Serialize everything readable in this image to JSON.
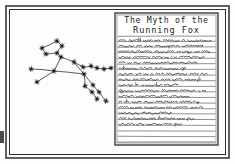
{
  "scene": {
    "kind": "hand-drawn-sketch",
    "background_color": "#fdfdfb",
    "ink_color": "#2b2b2b",
    "frame": {
      "name": "double-line-border",
      "outer": {
        "x": 6,
        "y": 6,
        "width": 223,
        "height": 152
      },
      "inner": {
        "x": 9,
        "y": 9,
        "width": 217,
        "height": 146
      },
      "stroke_color": "#3a3a3a"
    },
    "left_panel": {
      "title": "fox constellation sketch",
      "description": "star map of a leaping fox drawn as dots joined by straight lines"
    },
    "right_panel": {
      "title": "ruled notebook page",
      "description": "lined paper with a hand printed heading and illegible cursive body text"
    }
  },
  "constellation": {
    "name": "running-fox-constellation",
    "star_color": "#1f1f1f",
    "line_color": "#3c3c3c",
    "stars": [
      {
        "id": "ear-tip",
        "x": 57,
        "y": 41
      },
      {
        "id": "brow",
        "x": 62,
        "y": 46
      },
      {
        "id": "snout-upper",
        "x": 42,
        "y": 48
      },
      {
        "id": "snout-lower",
        "x": 46,
        "y": 54
      },
      {
        "id": "cheek",
        "x": 57,
        "y": 53
      },
      {
        "id": "neck",
        "x": 61,
        "y": 57
      },
      {
        "id": "shoulder",
        "x": 54,
        "y": 71
      },
      {
        "id": "chest",
        "x": 31,
        "y": 69
      },
      {
        "id": "foreleg-toe",
        "x": 37,
        "y": 82
      },
      {
        "id": "back-mid",
        "x": 74,
        "y": 62
      },
      {
        "id": "haunch",
        "x": 84,
        "y": 74
      },
      {
        "id": "tail-base",
        "x": 83,
        "y": 67
      },
      {
        "id": "tail-a",
        "x": 91,
        "y": 66
      },
      {
        "id": "tail-b",
        "x": 97,
        "y": 68
      },
      {
        "id": "tail-c",
        "x": 104,
        "y": 69
      },
      {
        "id": "tail-tip",
        "x": 111,
        "y": 68
      },
      {
        "id": "hind-a-knee",
        "x": 85,
        "y": 86
      },
      {
        "id": "hind-a-hock",
        "x": 92,
        "y": 92
      },
      {
        "id": "hind-a-toe",
        "x": 97,
        "y": 99
      },
      {
        "id": "hind-b-knee",
        "x": 93,
        "y": 85
      },
      {
        "id": "hind-b-hock",
        "x": 99,
        "y": 92
      },
      {
        "id": "hind-b-toe",
        "x": 106,
        "y": 101
      }
    ],
    "links": [
      [
        "snout-upper",
        "ear-tip"
      ],
      [
        "ear-tip",
        "brow"
      ],
      [
        "brow",
        "cheek"
      ],
      [
        "cheek",
        "snout-lower"
      ],
      [
        "snout-lower",
        "snout-upper"
      ],
      [
        "cheek",
        "neck"
      ],
      [
        "neck",
        "shoulder"
      ],
      [
        "shoulder",
        "chest"
      ],
      [
        "shoulder",
        "foreleg-toe"
      ],
      [
        "neck",
        "back-mid"
      ],
      [
        "back-mid",
        "tail-base"
      ],
      [
        "tail-base",
        "tail-a"
      ],
      [
        "tail-a",
        "tail-b"
      ],
      [
        "tail-b",
        "tail-c"
      ],
      [
        "tail-c",
        "tail-tip"
      ],
      [
        "back-mid",
        "haunch"
      ],
      [
        "shoulder",
        "haunch"
      ],
      [
        "haunch",
        "hind-a-knee"
      ],
      [
        "hind-a-knee",
        "hind-a-hock"
      ],
      [
        "hind-a-hock",
        "hind-a-toe"
      ],
      [
        "haunch",
        "hind-b-knee"
      ],
      [
        "hind-b-knee",
        "hind-b-hock"
      ],
      [
        "hind-b-hock",
        "hind-b-toe"
      ]
    ]
  },
  "notebook": {
    "name": "lined-paper",
    "sheet": {
      "x": 115,
      "y": 13,
      "width": 103,
      "height": 132
    },
    "paper_color": "#ffffff",
    "rule_color": "#555555",
    "border_color": "#2f2f2f",
    "heading": {
      "line1": "The Myth of the",
      "line2": "Running Fox"
    },
    "body_lines": [
      {
        "index": 1,
        "filled": true,
        "fill_ratio": 0.97
      },
      {
        "index": 2,
        "filled": true,
        "fill_ratio": 0.88
      },
      {
        "index": 3,
        "filled": true,
        "fill_ratio": 0.95
      },
      {
        "index": 4,
        "filled": true,
        "fill_ratio": 0.9
      },
      {
        "index": 5,
        "filled": true,
        "fill_ratio": 0.82
      },
      {
        "index": 6,
        "filled": true,
        "fill_ratio": 0.7
      },
      {
        "index": 7,
        "filled": true,
        "fill_ratio": 0.93
      },
      {
        "index": 8,
        "filled": true,
        "fill_ratio": 0.86
      },
      {
        "index": 9,
        "filled": true,
        "fill_ratio": 0.62
      },
      {
        "index": 10,
        "filled": true,
        "fill_ratio": 0.91
      },
      {
        "index": 11,
        "filled": true,
        "fill_ratio": 0.74
      },
      {
        "index": 12,
        "filled": true,
        "fill_ratio": 0.84
      },
      {
        "index": 13,
        "filled": true,
        "fill_ratio": 0.88
      },
      {
        "index": 14,
        "filled": true,
        "fill_ratio": 0.55
      },
      {
        "index": 15,
        "filled": true,
        "fill_ratio": 0.79
      },
      {
        "index": 16,
        "filled": true,
        "fill_ratio": 0.66
      },
      {
        "index": 17,
        "filled": false,
        "fill_ratio": 0.0
      },
      {
        "index": 18,
        "filled": false,
        "fill_ratio": 0.0
      },
      {
        "index": 19,
        "filled": false,
        "fill_ratio": 0.0
      }
    ],
    "body_text_legible": false,
    "body_text_note": "handwriting rendered as unreadable scribble"
  }
}
